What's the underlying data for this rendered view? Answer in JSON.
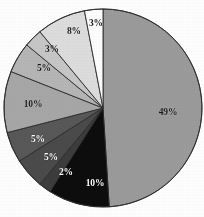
{
  "chart_data": {
    "type": "pie",
    "title": "",
    "subtitle": "",
    "xlabel": "",
    "ylabel": "",
    "grid": false,
    "legend": "none",
    "units": "percent",
    "total": 100,
    "start_angle_deg": 0,
    "direction": "clockwise",
    "center": {
      "x": 103,
      "y": 108
    },
    "radius": 99,
    "categories": [
      "Slice 1",
      "Slice 2",
      "Slice 3",
      "Slice 4",
      "Slice 5",
      "Slice 6",
      "Slice 7",
      "Slice 8",
      "Slice 9",
      "Slice 10"
    ],
    "values": [
      49,
      10,
      2,
      5,
      5,
      10,
      5,
      3,
      8,
      3
    ],
    "slices": [
      {
        "label": "49%",
        "value": 49,
        "color": "#9a9a9a",
        "label_color": "dark",
        "label_x": 168,
        "label_y": 113
      },
      {
        "label": "10%",
        "value": 10,
        "color": "#0d0d0d",
        "label_color": "light",
        "label_x": 95,
        "label_y": 184
      },
      {
        "label": "2%",
        "value": 2,
        "color": "#3c3c3c",
        "label_color": "light",
        "label_x": 66,
        "label_y": 173
      },
      {
        "label": "5%",
        "value": 5,
        "color": "#4a4a4a",
        "label_color": "light",
        "label_x": 51,
        "label_y": 158
      },
      {
        "label": "5%",
        "value": 5,
        "color": "#585858",
        "label_color": "light",
        "label_x": 38,
        "label_y": 140
      },
      {
        "label": "10%",
        "value": 10,
        "color": "#a6a6a6",
        "label_color": "dark",
        "label_x": 33,
        "label_y": 105
      },
      {
        "label": "5%",
        "value": 5,
        "color": "#b5b5b5",
        "label_color": "dark",
        "label_x": 44,
        "label_y": 69
      },
      {
        "label": "3%",
        "value": 3,
        "color": "#c6c6c6",
        "label_color": "dark",
        "label_x": 52,
        "label_y": 50
      },
      {
        "label": "8%",
        "value": 8,
        "color": "#dcdcdc",
        "label_color": "dark",
        "label_x": 74,
        "label_y": 32
      },
      {
        "label": "3%",
        "value": 3,
        "color": "#fcfcfc",
        "label_color": "dark",
        "label_x": 96,
        "label_y": 24
      }
    ],
    "stroke_color": "#2b2b2b",
    "stroke_width": 0.9,
    "background": "#fdfdfd"
  }
}
